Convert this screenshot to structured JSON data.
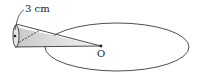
{
  "diagram": {
    "labels": {
      "radius": "3 cm",
      "center": "O"
    },
    "colors": {
      "stroke": "#222222",
      "shade_start": "#c8c8c8",
      "shade_end": "#f4f4f4"
    }
  }
}
